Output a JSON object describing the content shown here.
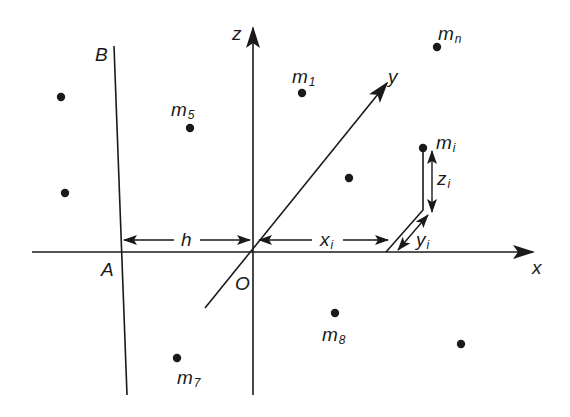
{
  "diagram": {
    "type": "coordinate-system with point masses",
    "stroke_color": "#1a1a1a",
    "background": "#ffffff",
    "axes": {
      "x": {
        "label": "x"
      },
      "y": {
        "label": "y"
      },
      "z": {
        "label": "z"
      },
      "origin": {
        "label": "O"
      }
    },
    "reference_line": {
      "top_label": "B",
      "bottom_label": "A"
    },
    "dimensions": {
      "h": {
        "label": "h"
      },
      "x_i": {
        "base": "x",
        "sub": "i"
      },
      "y_i": {
        "base": "y",
        "sub": "i"
      },
      "z_i": {
        "base": "z",
        "sub": "i"
      }
    },
    "masses": [
      {
        "base": "m",
        "sub": "1"
      },
      {
        "base": "m",
        "sub": "5"
      },
      {
        "base": "m",
        "sub": "n"
      },
      {
        "base": "m",
        "sub": "i"
      },
      {
        "base": "m",
        "sub": "8"
      },
      {
        "base": "m",
        "sub": "7"
      }
    ],
    "unlabeled_points_count": 4
  }
}
